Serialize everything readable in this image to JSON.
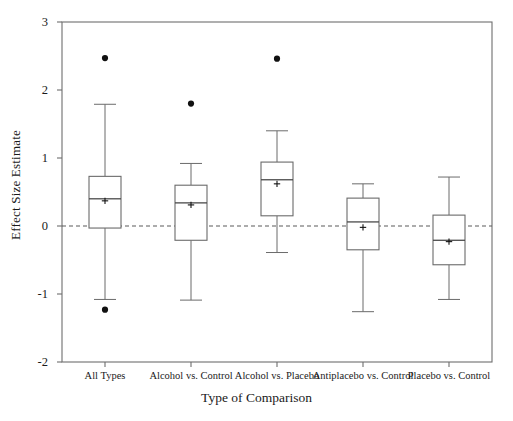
{
  "chart_data": {
    "type": "box",
    "title": "",
    "xlabel": "Type of Comparison",
    "ylabel": "Effect Size Estimate",
    "ylim": [
      -2,
      3
    ],
    "yticks": [
      -2,
      -1,
      0,
      1,
      2,
      3
    ],
    "ytick_labels": [
      "-2",
      "-1",
      "0",
      "1",
      "2",
      "3"
    ],
    "grid": false,
    "legend": null,
    "reference_line": {
      "y": 0,
      "style": "dashed"
    },
    "mean_marker": "plus",
    "categories": [
      "All Types",
      "Alcohol vs. Control",
      "Alcohol vs. Placebo",
      "Antiplacebo vs. Control",
      "Placebo vs. Control"
    ],
    "boxes": [
      {
        "category": "All Types",
        "whisker_low": -1.08,
        "q1": -0.03,
        "median": 0.4,
        "q3": 0.73,
        "whisker_high": 1.79,
        "mean": 0.37,
        "outliers": [
          2.47,
          -1.23
        ]
      },
      {
        "category": "Alcohol vs. Control",
        "whisker_low": -1.09,
        "q1": -0.21,
        "median": 0.34,
        "q3": 0.6,
        "whisker_high": 0.92,
        "mean": 0.31,
        "outliers": [
          1.8
        ]
      },
      {
        "category": "Alcohol vs. Placebo",
        "whisker_low": -0.39,
        "q1": 0.15,
        "median": 0.68,
        "q3": 0.94,
        "whisker_high": 1.4,
        "mean": 0.62,
        "outliers": [
          2.46
        ]
      },
      {
        "category": "Antiplacebo vs. Control",
        "whisker_low": -1.26,
        "q1": -0.35,
        "median": 0.06,
        "q3": 0.41,
        "whisker_high": 0.62,
        "mean": -0.02,
        "outliers": []
      },
      {
        "category": "Placebo vs. Control",
        "whisker_low": -1.08,
        "q1": -0.57,
        "median": -0.21,
        "q3": 0.16,
        "whisker_high": 0.72,
        "mean": -0.23,
        "outliers": []
      }
    ],
    "colors": {
      "axis": "#6e6e6e",
      "box_stroke": "#6b6b6b",
      "whisker": "#6b6b6b",
      "median": "#4a4a4a",
      "outlier": "#111111",
      "reference_line": "#5a5a5a",
      "text": "#1a1a1a",
      "background": "#ffffff"
    }
  }
}
